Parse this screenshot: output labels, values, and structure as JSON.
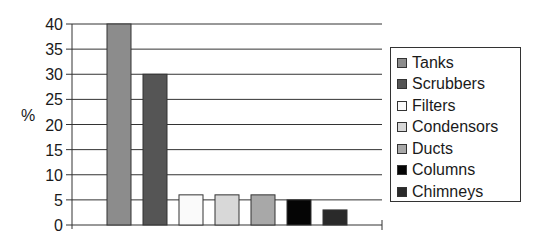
{
  "chart_data": {
    "type": "bar",
    "title": "",
    "xlabel": "",
    "ylabel": "%",
    "ylim": [
      0,
      40
    ],
    "yticks": [
      0,
      5,
      10,
      15,
      20,
      25,
      30,
      35,
      40
    ],
    "grid": true,
    "legend_position": "right",
    "categories": [
      "Tanks",
      "Scrubbers",
      "Filters",
      "Condensors",
      "Ducts",
      "Columns",
      "Chimneys"
    ],
    "values": [
      40,
      30,
      6,
      6,
      6,
      5,
      3
    ],
    "colors": [
      "#8c8c8c",
      "#555555",
      "#fafafa",
      "#d8d8d8",
      "#a8a8a8",
      "#050505",
      "#2a2a2a"
    ]
  },
  "legend": {
    "items": [
      {
        "label": "Tanks",
        "color": "#8c8c8c"
      },
      {
        "label": "Scrubbers",
        "color": "#555555"
      },
      {
        "label": "Filters",
        "color": "#fafafa"
      },
      {
        "label": "Condensors",
        "color": "#d8d8d8"
      },
      {
        "label": "Ducts",
        "color": "#a8a8a8"
      },
      {
        "label": "Columns",
        "color": "#050505"
      },
      {
        "label": "Chimneys",
        "color": "#2a2a2a"
      }
    ]
  }
}
